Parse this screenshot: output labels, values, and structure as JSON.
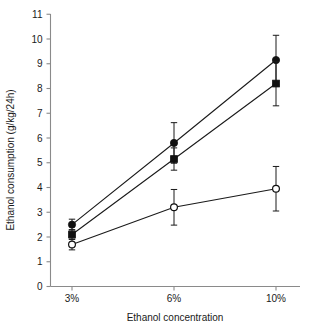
{
  "chart_data": {
    "type": "line",
    "title": "",
    "subtitle": "",
    "xlabel": "Ethanol concentration",
    "ylabel": "Ethanol consumption (g/kg/24h)",
    "categories": [
      "3%",
      "6%",
      "10%"
    ],
    "x_tick_labels": [
      "3%",
      "6%",
      "10%"
    ],
    "y_tick_labels": [
      "0",
      "1",
      "2",
      "3",
      "4",
      "5",
      "6",
      "7",
      "8",
      "9",
      "10",
      "11"
    ],
    "y_ticks": [
      0,
      1,
      2,
      3,
      4,
      5,
      6,
      7,
      8,
      9,
      10,
      11
    ],
    "ylim": [
      0,
      11
    ],
    "grid": false,
    "legend": "none",
    "legend_position": "none",
    "error_bar_type": "symmetric",
    "series": [
      {
        "name": "filled-circle-series",
        "marker": "filled-circle",
        "color": "#111111",
        "values": [
          2.5,
          5.8,
          9.15
        ],
        "errors": [
          0.22,
          0.82,
          1.0
        ],
        "err_low": [
          2.28,
          4.98,
          8.15
        ],
        "err_high": [
          2.72,
          6.62,
          10.15
        ]
      },
      {
        "name": "filled-square-series",
        "marker": "filled-square",
        "color": "#111111",
        "values": [
          2.1,
          5.15,
          8.2
        ],
        "errors": [
          0.2,
          0.45,
          0.9
        ],
        "err_low": [
          1.9,
          4.7,
          7.3
        ],
        "err_high": [
          2.3,
          5.6,
          9.1
        ]
      },
      {
        "name": "open-circle-series",
        "marker": "open-circle",
        "color": "#111111",
        "values": [
          1.7,
          3.2,
          3.95
        ],
        "errors": [
          0.22,
          0.72,
          0.9
        ],
        "err_low": [
          1.48,
          2.48,
          3.05
        ],
        "err_high": [
          1.92,
          3.92,
          4.85
        ]
      }
    ]
  },
  "colors": {
    "axis": "#8a8a8a",
    "ink": "#111111",
    "background": "#ffffff"
  }
}
